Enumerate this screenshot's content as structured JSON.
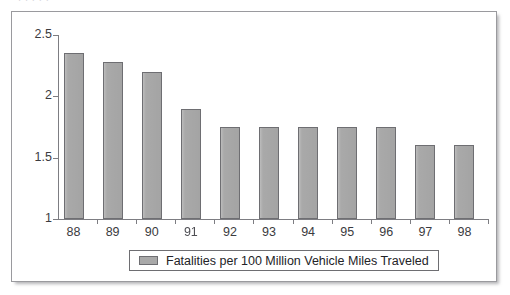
{
  "page": {
    "title_remnant": ". . .                        .            .",
    "panel_border_color": "#9a9a9e",
    "background_color": "#ffffff"
  },
  "chart_data": {
    "type": "bar",
    "title": "",
    "xlabel": "",
    "ylabel": "",
    "categories": [
      "88",
      "89",
      "90",
      "91",
      "92",
      "93",
      "94",
      "95",
      "96",
      "97",
      "98"
    ],
    "values": [
      2.35,
      2.28,
      2.2,
      1.9,
      1.75,
      1.75,
      1.75,
      1.75,
      1.75,
      1.6,
      1.6
    ],
    "ylim": [
      1,
      2.5
    ],
    "ytick_values": [
      1,
      1.5,
      2,
      2.5
    ],
    "ytick_labels": [
      "1",
      "1.5",
      "2",
      "2.5"
    ],
    "grid": false,
    "legend_position": "bottom",
    "series": [
      {
        "name": "Fatalities per 100 Million Vehicle Miles Traveled",
        "color": "#a9a9a9",
        "values": [
          2.35,
          2.28,
          2.2,
          1.9,
          1.75,
          1.75,
          1.75,
          1.75,
          1.75,
          1.6,
          1.6
        ]
      }
    ]
  },
  "legend": {
    "items": [
      {
        "label": "Fatalities per 100 Million Vehicle Miles Traveled",
        "color": "#a9a9a9"
      }
    ]
  },
  "axis": {
    "bar_fill_color": "#a9a9a9",
    "bar_border_color": "#6e6e72",
    "axis_line_color": "#7d7d82",
    "tick_label_color": "#3b3b40"
  }
}
